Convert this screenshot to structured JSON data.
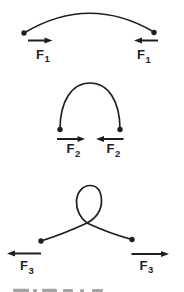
{
  "colors": {
    "ink": "#1f1f1f",
    "background": "#ffffff"
  },
  "figures": [
    {
      "name": "slightly-bowed-rod",
      "shape": "shallow arc bowed upward between two endpoint dots",
      "force_symbol": "F",
      "force_subscript": "1",
      "left_arrow_direction": "points right (inward)",
      "right_arrow_direction": "points left (inward)"
    },
    {
      "name": "arched-rod",
      "shape": "tall narrow arch between two endpoint dots",
      "force_symbol": "F",
      "force_subscript": "2",
      "left_arrow_direction": "points right (inward)",
      "right_arrow_direction": "points left (inward)"
    },
    {
      "name": "looped-rod",
      "shape": "rod buckled into a single crossed loop between two endpoint dots",
      "force_symbol": "F",
      "force_subscript": "3",
      "left_arrow_direction": "points left (outward)",
      "right_arrow_direction": "points right (outward)"
    }
  ],
  "bottom_edge": {
    "cutoff_caption_visible": true
  }
}
